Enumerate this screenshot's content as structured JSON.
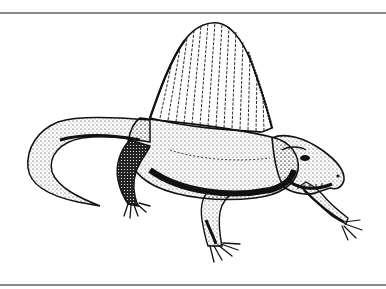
{
  "figure": {
    "style": "black ink stipple line drawing",
    "colors": {
      "background": "#ffffff",
      "ink": "#111111",
      "rule": "#8a8a8a"
    }
  }
}
